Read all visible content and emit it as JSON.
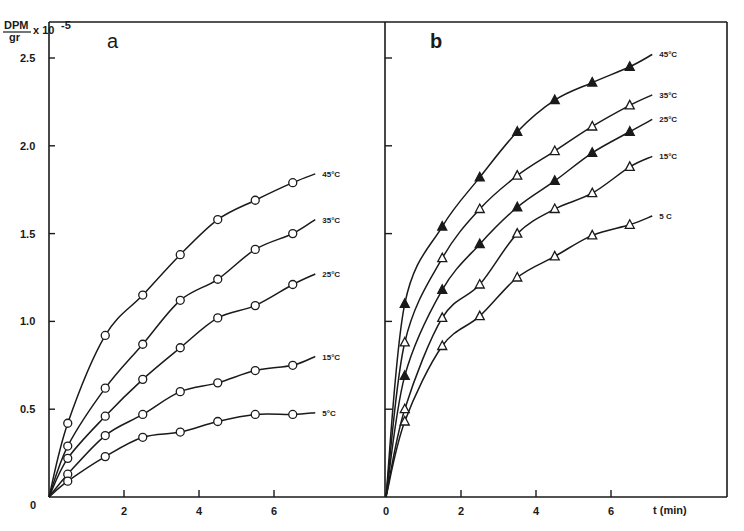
{
  "chart_data": [
    {
      "type": "scatter",
      "panel": "a",
      "title": "a",
      "xlabel": "",
      "ylabel": "DPM/gr x 10^-5",
      "ylabel_parts": {
        "numerator": "DPM",
        "denominator": "gr",
        "multiplier": "x 10",
        "exponent": "-5"
      },
      "xlim": [
        0,
        8.9
      ],
      "ylim": [
        0,
        2.7
      ],
      "xticks": [
        "0",
        "2",
        "4",
        "6"
      ],
      "yticks": [
        "0",
        "0.5",
        "1.0",
        "1.5",
        "2.0",
        "2.5"
      ],
      "marker": "circle-open",
      "x": [
        0.5,
        1.5,
        2.5,
        3.5,
        4.5,
        5.5,
        6.5
      ],
      "series": [
        {
          "name": "45°C",
          "label": "45°C",
          "values": [
            0.42,
            0.92,
            1.15,
            1.38,
            1.58,
            1.69,
            1.79
          ],
          "fit_end": 1.84
        },
        {
          "name": "35°C",
          "label": "35°C",
          "values": [
            0.29,
            0.62,
            0.87,
            1.12,
            1.24,
            1.41,
            1.5
          ],
          "fit_end": 1.58
        },
        {
          "name": "25°C",
          "label": "25°C",
          "values": [
            0.22,
            0.46,
            0.67,
            0.85,
            1.02,
            1.09,
            1.21
          ],
          "fit_end": 1.27
        },
        {
          "name": "15°C",
          "label": "15°C",
          "values": [
            0.13,
            0.35,
            0.47,
            0.6,
            0.65,
            0.72,
            0.75
          ],
          "fit_end": 0.8
        },
        {
          "name": "5°C",
          "label": "5°C",
          "values": [
            0.09,
            0.23,
            0.34,
            0.37,
            0.43,
            0.47,
            0.47
          ],
          "fit_end": 0.48
        }
      ],
      "grid": false,
      "legend": "inline labels at curve ends"
    },
    {
      "type": "scatter",
      "panel": "b",
      "title": "b",
      "xlabel": "t (min)",
      "ylabel": "DPM/gr x 10^-5",
      "xlim": [
        0,
        9.0
      ],
      "ylim": [
        0,
        2.7
      ],
      "xticks": [
        "0",
        "2",
        "4",
        "6"
      ],
      "marker": "triangle",
      "x": [
        0.5,
        1.5,
        2.5,
        3.5,
        4.5,
        5.5,
        6.5
      ],
      "series": [
        {
          "name": "45°C",
          "label": "45°C",
          "filled": true,
          "values": [
            1.1,
            1.54,
            1.82,
            2.08,
            2.26,
            2.36,
            2.45
          ],
          "fit_end": 2.52
        },
        {
          "name": "35°C",
          "label": "35°C",
          "filled": false,
          "values": [
            0.88,
            1.36,
            1.64,
            1.83,
            1.97,
            2.11,
            2.23
          ],
          "fit_end": 2.29
        },
        {
          "name": "25°C",
          "label": "25°C",
          "filled": true,
          "values": [
            0.69,
            1.18,
            1.44,
            1.65,
            1.8,
            1.96,
            2.08
          ],
          "fit_end": 2.15
        },
        {
          "name": "15°C",
          "label": "15°C",
          "filled": false,
          "values": [
            0.5,
            1.02,
            1.21,
            1.5,
            1.64,
            1.73,
            1.88
          ],
          "fit_end": 1.94
        },
        {
          "name": "5°C",
          "label": "5 C",
          "filled": false,
          "values": [
            0.43,
            0.86,
            1.03,
            1.25,
            1.37,
            1.49,
            1.55
          ],
          "fit_end": 1.6
        }
      ],
      "grid": false,
      "legend": "inline labels at curve ends"
    }
  ],
  "axis": {
    "y_num": "DPM",
    "y_den": "gr",
    "y_mult": "x 10",
    "y_exp": "-5",
    "panel_a": "a",
    "panel_b": "b",
    "x_title": "t (min)"
  }
}
